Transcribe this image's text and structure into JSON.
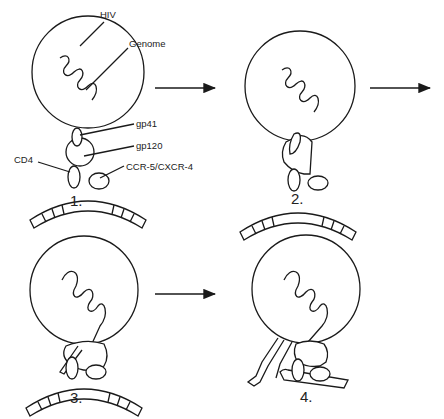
{
  "labels": {
    "hiv": "HIV",
    "genome": "Genome",
    "gp41": "gp41",
    "gp120": "gp120",
    "cd4": "CD4",
    "coreceptor": "CCR-5/CXCR-4"
  },
  "steps": [
    {
      "number": "1."
    },
    {
      "number": "2."
    },
    {
      "number": "3."
    },
    {
      "number": "4."
    }
  ],
  "colors": {
    "line": "#1a1a1a",
    "background": "#ffffff"
  }
}
